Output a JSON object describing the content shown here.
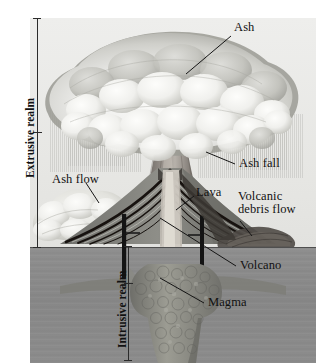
{
  "figure": {
    "type": "geology-cutaway-block-diagram",
    "background_color": "#ffffff",
    "sky_color": "#e9e9e7",
    "subsurface_color": "#8a8a8a",
    "ink_color": "#151515"
  },
  "brackets": [
    {
      "id": "extrusive",
      "label": "Extrusive realm",
      "orientation": "vertical",
      "reads": "bottom-to-top",
      "spans": "from top of ash cloud down to ground surface"
    },
    {
      "id": "intrusive",
      "label": "Intrusive realm",
      "orientation": "vertical",
      "reads": "bottom-to-top",
      "spans": "from ground surface down to base of magma body"
    }
  ],
  "callouts": [
    {
      "id": "ash",
      "label": "Ash",
      "side": "right",
      "lines": 1
    },
    {
      "id": "ash-fall",
      "label": "Ash fall",
      "side": "right",
      "lines": 1
    },
    {
      "id": "ash-flow",
      "label": "Ash flow",
      "side": "left",
      "lines": 1
    },
    {
      "id": "lava",
      "label": "Lava",
      "side": "right",
      "lines": 1
    },
    {
      "id": "volcanic-debris-flow",
      "label": "Volcanic debris flow",
      "side": "right",
      "lines": 2,
      "line1": "Volcanic",
      "line2": "debris flow"
    },
    {
      "id": "volcano",
      "label": "Volcano",
      "side": "right",
      "lines": 1
    },
    {
      "id": "magma",
      "label": "Magma",
      "side": "right",
      "lines": 1
    }
  ],
  "features": {
    "ash_cloud": "billowing mushroom-shaped eruption column cap",
    "eruption_column": "dark vertical ash column rising from the vent",
    "ash_fall_streaks": "fine vertical streaks falling from cloud underside",
    "ash_flow_deposit": "pale lobate cloud hugging the left flank",
    "volcano_cone": "stratovolcano with alternating dark lava and ash layers",
    "debris_flow_lobe": "dark lobe spreading down the right flank",
    "conduit": "pale vertical pipe feeding the summit vent",
    "dikes": "two dark vertical sheets cutting the cone flanks",
    "magma_body": "mottled pluton at depth with lateral sill offshoots",
    "ground_surface": "horizontal land surface line"
  }
}
